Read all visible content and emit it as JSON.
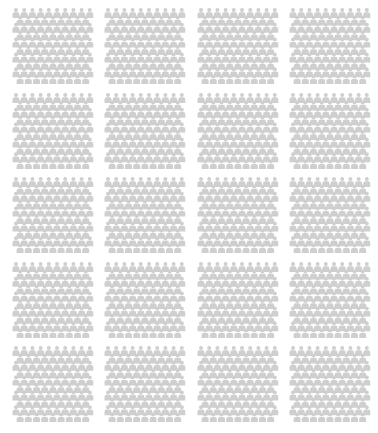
{
  "figure": {
    "icon": "person-icon",
    "icon_color": "#cfcfcf",
    "background": "#ffffff",
    "block_rows": 5,
    "block_cols": 4,
    "icons_per_row": 10,
    "rows_per_block": 10
  },
  "blocks": [
    {
      "row": 0,
      "col": 0
    },
    {
      "row": 0,
      "col": 1
    },
    {
      "row": 0,
      "col": 2
    },
    {
      "row": 0,
      "col": 3
    },
    {
      "row": 1,
      "col": 0
    },
    {
      "row": 1,
      "col": 1
    },
    {
      "row": 1,
      "col": 2
    },
    {
      "row": 1,
      "col": 3
    },
    {
      "row": 2,
      "col": 0
    },
    {
      "row": 2,
      "col": 1
    },
    {
      "row": 2,
      "col": 2
    },
    {
      "row": 2,
      "col": 3
    },
    {
      "row": 3,
      "col": 0
    },
    {
      "row": 3,
      "col": 1
    },
    {
      "row": 3,
      "col": 2
    },
    {
      "row": 3,
      "col": 3
    },
    {
      "row": 4,
      "col": 0
    },
    {
      "row": 4,
      "col": 1
    },
    {
      "row": 4,
      "col": 2
    },
    {
      "row": 4,
      "col": 3
    }
  ]
}
